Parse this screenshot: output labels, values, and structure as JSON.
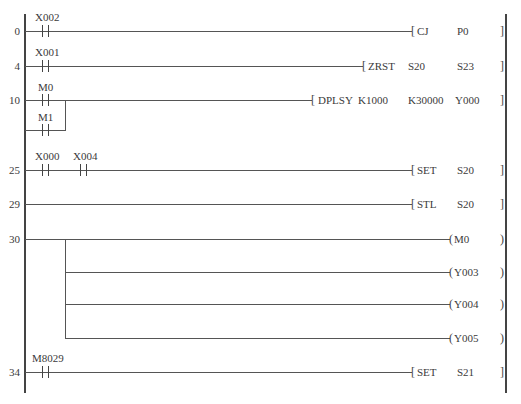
{
  "diagram": {
    "type": "PLC ladder diagram",
    "rungs": [
      {
        "step": "0",
        "contacts": [
          {
            "label": "X002"
          }
        ],
        "instruction": {
          "op": "CJ",
          "operands": [
            "P0"
          ]
        }
      },
      {
        "step": "4",
        "contacts": [
          {
            "label": "X001"
          }
        ],
        "instruction": {
          "op": "ZRST",
          "operands": [
            "S20",
            "S23"
          ]
        }
      },
      {
        "step": "10",
        "contacts": [
          {
            "label": "M0"
          }
        ],
        "parallel_contacts": [
          {
            "label": "M1"
          }
        ],
        "instruction": {
          "op": "DPLSY",
          "operands": [
            "K1000",
            "K30000",
            "Y000"
          ]
        }
      },
      {
        "step": "25",
        "contacts": [
          {
            "label": "X000"
          },
          {
            "label": "X004"
          }
        ],
        "instruction": {
          "op": "SET",
          "operands": [
            "S20"
          ]
        }
      },
      {
        "step": "29",
        "contacts": [],
        "instruction": {
          "op": "STL",
          "operands": [
            "S20"
          ]
        }
      },
      {
        "step": "30",
        "contacts": [],
        "coils": [
          "M0",
          "Y003",
          "Y004",
          "Y005"
        ]
      },
      {
        "step": "34",
        "contacts": [
          {
            "label": "M8029"
          }
        ],
        "instruction": {
          "op": "SET",
          "operands": [
            "S21"
          ]
        }
      }
    ],
    "open_bracket": "[",
    "close_bracket": "]",
    "coil_open": "(",
    "coil_close": ")"
  }
}
